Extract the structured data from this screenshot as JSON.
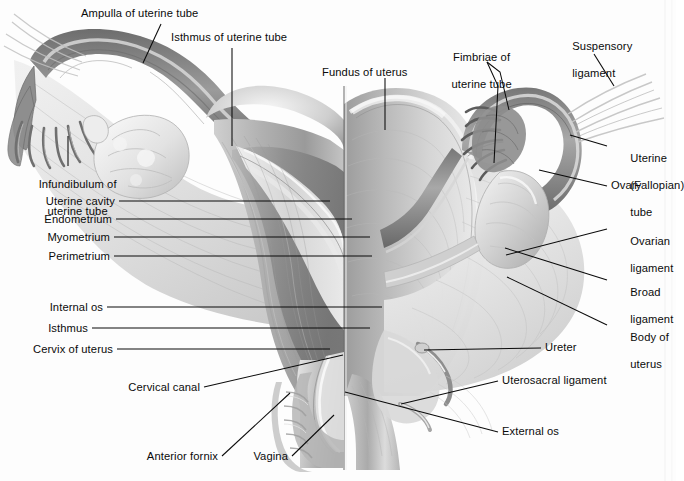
{
  "figure": {
    "background_color": "#fdfdfd",
    "ink_color": "#0a0a0a",
    "style": "grayscale medical illustration"
  },
  "labels": {
    "ampulla": "Ampulla of uterine tube",
    "isthmus_tube": "Isthmus of uterine tube",
    "fundus": "Fundus of uterus",
    "fimbriae_line1": "Fimbriae of",
    "fimbriae_line2": "uterine tube",
    "suspensory_line1": "Suspensory",
    "suspensory_line2": "ligament",
    "uterine_tube_line1": "Uterine",
    "uterine_tube_line2": "(Fallopian)",
    "uterine_tube_line3": "tube",
    "ovary": "Ovary",
    "ovarian_ligament_line1": "Ovarian",
    "ovarian_ligament_line2": "ligament",
    "broad_ligament_line1": "Broad",
    "broad_ligament_line2": "ligament",
    "body_of_uterus_line1": "Body of",
    "body_of_uterus_line2": "uterus",
    "ureter": "Ureter",
    "uterosacral": "Uterosacral ligament",
    "external_os": "External os",
    "infundibulum_line1": "Infundibulum of",
    "infundibulum_line2": "uterine tube",
    "uterine_cavity": "Uterine cavity",
    "endometrium": "Endometrium",
    "myometrium": "Myometrium",
    "perimetrium": "Perimetrium",
    "internal_os": "Internal os",
    "isthmus": "Isthmus",
    "cervix": "Cervix of uterus",
    "cervical_canal": "Cervical canal",
    "anterior_fornix": "Anterior fornix",
    "vagina": "Vagina"
  }
}
